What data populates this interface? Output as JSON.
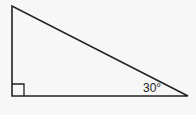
{
  "diagram": {
    "type": "right-triangle",
    "vertices": {
      "top_left": [
        12,
        6
      ],
      "bottom_left": [
        12,
        96
      ],
      "bottom_right": [
        188,
        96
      ]
    },
    "right_angle_marker": {
      "at": "bottom_left",
      "size": 12
    },
    "angle_label": {
      "text": "30°",
      "vertex": "bottom_right"
    },
    "colors": {
      "stroke": "#222222",
      "background": "#f7f7f7"
    }
  }
}
